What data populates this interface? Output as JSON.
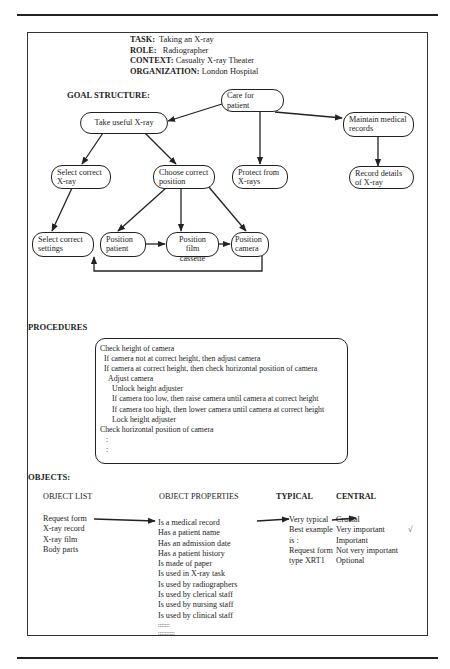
{
  "header": {
    "task_label": "TASK:",
    "task_value": "Taking an X-ray",
    "role_label": "ROLE:",
    "role_value": "Radiographer",
    "context_label": "CONTEXT:",
    "context_value": "Casualty X-ray Theater",
    "organization_label": "ORGANIZATION:",
    "organization_value": "London Hospital"
  },
  "goal_structure": {
    "title": "GOAL STRUCTURE:",
    "nodes": {
      "care": "Care for patient",
      "take_xray": "Take useful X-ray",
      "maintain": "Maintain medical records",
      "select_xray": "Select correct X-ray",
      "choose_position": "Choose correct position",
      "protect": "Protect from X-rays",
      "record": "Record details of X-ray",
      "select_settings": "Select correct settings",
      "position_patient": "Position patient",
      "position_film": "Position film cassette",
      "position_camera": "Position camera"
    }
  },
  "procedures": {
    "title": "PROCEDURES",
    "lines": [
      {
        "indent": 0,
        "text": "Check height of camera"
      },
      {
        "indent": 1,
        "text": "If camera not at correct height, then adjust camera"
      },
      {
        "indent": 1,
        "text": "If camera at correct height, then check horizontal  position of camera"
      },
      {
        "indent": 2,
        "text": "Adjust camera"
      },
      {
        "indent": 3,
        "text": "Unlock height  adjuster"
      },
      {
        "indent": 3,
        "text": "If camera too low, then raise camera until camera at correct height"
      },
      {
        "indent": 3,
        "text": "If camera  too high, then lower camera until camera at correct height"
      },
      {
        "indent": 3,
        "text": "Lock height adjuster"
      },
      {
        "indent": 0,
        "text": "Check horizontal position of camera"
      },
      {
        "indent": 1,
        "text": ":"
      },
      {
        "indent": 1,
        "text": ":"
      }
    ]
  },
  "objects": {
    "title": "OBJECTS:",
    "columns": {
      "list": "OBJECT LIST",
      "properties": "OBJECT PROPERTIES",
      "typical": "TYPICAL",
      "central": "CENTRAL"
    },
    "object_list": [
      "Request  form",
      "X-ray record",
      "X-ray film",
      "Body parts"
    ],
    "properties": [
      "Is a medical record",
      "Has a patient name",
      "Has an admission date",
      "Has a patient history",
      "Is made of paper",
      "Is used in X-ray task",
      "Is used by radiographers",
      "Is used by clerical staff",
      "Is used by nursing staff",
      "Is used by clinical staff",
      ":::::::",
      "::::::::::"
    ],
    "typical": [
      "Very typical",
      "Best example",
      "is :",
      "Request form",
      "type XRT1"
    ],
    "central": [
      "Crucial",
      "Very important",
      "Important",
      "Not very important",
      "Optional"
    ],
    "check_mark": "√"
  }
}
